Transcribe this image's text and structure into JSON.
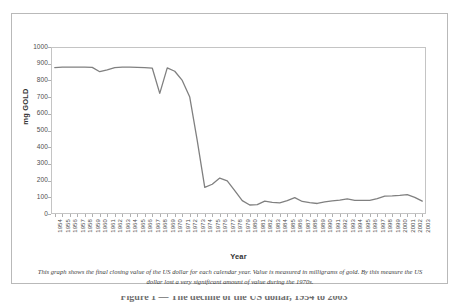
{
  "figure": {
    "caption": "This graph shows the final closing value of the US dollar for each calendar year.  Value is measured in milligrams of gold.  By this measure the US dollar lost a very significant amount of value during the 1970s.",
    "footer_text": "Figure 1 — The decline of the US dollar, 1954 to 2003"
  },
  "chart_data": {
    "type": "line",
    "title": "",
    "xlabel": "Year",
    "ylabel": "mg GOLD",
    "ylim": [
      0,
      1000
    ],
    "y_ticks": [
      0,
      100,
      200,
      300,
      400,
      500,
      600,
      700,
      800,
      900,
      1000
    ],
    "grid": false,
    "legend": "none",
    "line_color": "#808080",
    "categories": [
      "1954",
      "1955",
      "1956",
      "1957",
      "1958",
      "1959",
      "1960",
      "1961",
      "1962",
      "1963",
      "1964",
      "1965",
      "1966",
      "1967",
      "1968",
      "1969",
      "1970",
      "1971",
      "1972",
      "1973",
      "1974",
      "1975",
      "1976",
      "1977",
      "1978",
      "1979",
      "1980",
      "1981",
      "1982",
      "1983",
      "1984",
      "1985",
      "1986",
      "1987",
      "1988",
      "1989",
      "1990",
      "1991",
      "1992",
      "1993",
      "1994",
      "1995",
      "1996",
      "1997",
      "1998",
      "1999",
      "2000",
      "2001",
      "2002",
      "2003"
    ],
    "values": [
      877,
      880,
      880,
      880,
      880,
      878,
      852,
      863,
      876,
      879,
      880,
      878,
      876,
      874,
      722,
      875,
      855,
      800,
      700,
      440,
      160,
      178,
      215,
      198,
      140,
      80,
      54,
      56,
      77,
      70,
      67,
      80,
      98,
      75,
      68,
      63,
      72,
      79,
      83,
      90,
      82,
      81,
      82,
      92,
      107,
      109,
      112,
      116,
      100,
      77
    ]
  }
}
